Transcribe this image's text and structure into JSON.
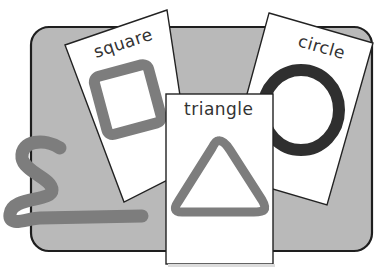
{
  "illustration": {
    "colors": {
      "background": "#ffffff",
      "board_fill": "#b9b9b9",
      "board_stroke": "#1e1e1e",
      "card_fill": "#ffffff",
      "card_stroke": "#222222",
      "shape_gray": "#7d7d7d",
      "shape_dark": "#2f2f2f",
      "label_color": "#333333"
    },
    "cards": [
      {
        "label": "square",
        "shape": "square-outline",
        "shape_color": "#7d7d7d"
      },
      {
        "label": "circle",
        "shape": "circle-outline",
        "shape_color": "#2f2f2f"
      },
      {
        "label": "triangle",
        "shape": "triangle-outline",
        "shape_color": "#7d7d7d"
      }
    ],
    "loose_shape": {
      "kind": "s-curve-snake",
      "color": "#7d7d7d"
    }
  }
}
